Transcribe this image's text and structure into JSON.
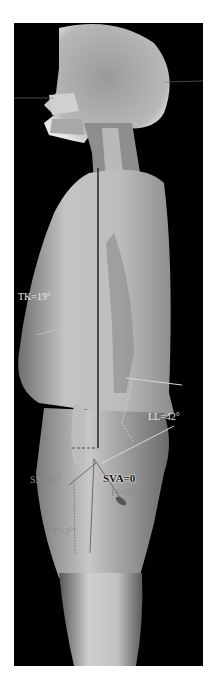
{
  "image": {
    "description": "Lateral full-spine standing radiograph with sagittal alignment measurements",
    "background_color": "#000000",
    "page_color": "#ffffff"
  },
  "annotations": {
    "thoracic_kyphosis": "TK=19°",
    "lumbar_lordosis": "LL=42°",
    "sagittal_vertical_axis": "SVA=0",
    "sacral_slope": "SS=33°",
    "pelvic_incidence": "PI=36°",
    "pelvic_tilt": "PT=3°"
  },
  "colors": {
    "plumb_line": "#1a1a1a",
    "measurement_lines": "#d8d8d8",
    "label_light": "#e9e9e9",
    "label_gray": "#8a8a8a"
  }
}
